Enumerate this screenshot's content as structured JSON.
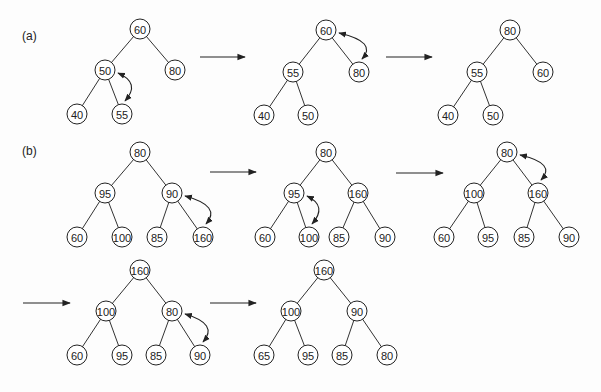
{
  "figure": {
    "parts": [
      {
        "label": "(a)",
        "label_pos": [
          22,
          40
        ],
        "trees": [
          {
            "id": "a1",
            "nodes": [
              {
                "v": "60",
                "x": 140,
                "y": 29
              },
              {
                "v": "50",
                "x": 105,
                "y": 70
              },
              {
                "v": "80",
                "x": 175,
                "y": 70
              },
              {
                "v": "40",
                "x": 77,
                "y": 114
              },
              {
                "v": "55",
                "x": 122,
                "y": 114
              }
            ],
            "edges": [
              [
                0,
                1
              ],
              [
                0,
                2
              ],
              [
                1,
                3
              ],
              [
                1,
                4
              ]
            ],
            "swap": [
              1,
              4
            ]
          },
          {
            "id": "a2",
            "nodes": [
              {
                "v": "60",
                "x": 326,
                "y": 30
              },
              {
                "v": "55",
                "x": 293,
                "y": 72
              },
              {
                "v": "80",
                "x": 359,
                "y": 72
              },
              {
                "v": "40",
                "x": 264,
                "y": 115
              },
              {
                "v": "50",
                "x": 308,
                "y": 115
              }
            ],
            "edges": [
              [
                0,
                1
              ],
              [
                0,
                2
              ],
              [
                1,
                3
              ],
              [
                1,
                4
              ]
            ],
            "swap": [
              0,
              2
            ]
          },
          {
            "id": "a3",
            "nodes": [
              {
                "v": "80",
                "x": 510,
                "y": 30
              },
              {
                "v": "55",
                "x": 477,
                "y": 72
              },
              {
                "v": "60",
                "x": 543,
                "y": 72
              },
              {
                "v": "40",
                "x": 448,
                "y": 115
              },
              {
                "v": "50",
                "x": 493,
                "y": 115
              }
            ],
            "edges": [
              [
                0,
                1
              ],
              [
                0,
                2
              ],
              [
                1,
                3
              ],
              [
                1,
                4
              ]
            ],
            "swap": null
          }
        ],
        "arrows": [
          {
            "x1": 200,
            "x2": 245,
            "y": 57
          },
          {
            "x1": 386,
            "x2": 432,
            "y": 57
          }
        ]
      },
      {
        "label": "(b)",
        "label_pos": [
          22,
          155
        ],
        "trees": [
          {
            "id": "b1",
            "nodes": [
              {
                "v": "80",
                "x": 140,
                "y": 152
              },
              {
                "v": "95",
                "x": 105,
                "y": 193
              },
              {
                "v": "90",
                "x": 172,
                "y": 193
              },
              {
                "v": "60",
                "x": 77,
                "y": 237
              },
              {
                "v": "100",
                "x": 122,
                "y": 237
              },
              {
                "v": "85",
                "x": 157,
                "y": 237
              },
              {
                "v": "160",
                "x": 203,
                "y": 237
              }
            ],
            "edges": [
              [
                0,
                1
              ],
              [
                0,
                2
              ],
              [
                1,
                3
              ],
              [
                1,
                4
              ],
              [
                2,
                5
              ],
              [
                2,
                6
              ]
            ],
            "swap": [
              2,
              6
            ]
          },
          {
            "id": "b2",
            "nodes": [
              {
                "v": "80",
                "x": 326,
                "y": 152
              },
              {
                "v": "95",
                "x": 294,
                "y": 193
              },
              {
                "v": "160",
                "x": 358,
                "y": 193
              },
              {
                "v": "60",
                "x": 265,
                "y": 237
              },
              {
                "v": "100",
                "x": 309,
                "y": 237
              },
              {
                "v": "85",
                "x": 339,
                "y": 237
              },
              {
                "v": "90",
                "x": 385,
                "y": 237
              }
            ],
            "edges": [
              [
                0,
                1
              ],
              [
                0,
                2
              ],
              [
                1,
                3
              ],
              [
                1,
                4
              ],
              [
                2,
                5
              ],
              [
                2,
                6
              ]
            ],
            "swap": [
              1,
              4
            ]
          },
          {
            "id": "b3",
            "nodes": [
              {
                "v": "80",
                "x": 507,
                "y": 152
              },
              {
                "v": "100",
                "x": 474,
                "y": 193
              },
              {
                "v": "160",
                "x": 538,
                "y": 193
              },
              {
                "v": "60",
                "x": 444,
                "y": 237
              },
              {
                "v": "95",
                "x": 488,
                "y": 237
              },
              {
                "v": "85",
                "x": 524,
                "y": 237
              },
              {
                "v": "90",
                "x": 569,
                "y": 237
              }
            ],
            "edges": [
              [
                0,
                1
              ],
              [
                0,
                2
              ],
              [
                1,
                3
              ],
              [
                1,
                4
              ],
              [
                2,
                5
              ],
              [
                2,
                6
              ]
            ],
            "swap": [
              0,
              2
            ]
          },
          {
            "id": "b4",
            "nodes": [
              {
                "v": "160",
                "x": 140,
                "y": 270
              },
              {
                "v": "100",
                "x": 106,
                "y": 311
              },
              {
                "v": "80",
                "x": 172,
                "y": 311
              },
              {
                "v": "60",
                "x": 77,
                "y": 355
              },
              {
                "v": "95",
                "x": 122,
                "y": 355
              },
              {
                "v": "85",
                "x": 156,
                "y": 355
              },
              {
                "v": "90",
                "x": 200,
                "y": 355
              }
            ],
            "edges": [
              [
                0,
                1
              ],
              [
                0,
                2
              ],
              [
                1,
                3
              ],
              [
                1,
                4
              ],
              [
                2,
                5
              ],
              [
                2,
                6
              ]
            ],
            "swap": [
              2,
              6
            ]
          },
          {
            "id": "b5",
            "nodes": [
              {
                "v": "160",
                "x": 324,
                "y": 270
              },
              {
                "v": "100",
                "x": 291,
                "y": 311
              },
              {
                "v": "90",
                "x": 357,
                "y": 311
              },
              {
                "v": "65",
                "x": 264,
                "y": 355
              },
              {
                "v": "95",
                "x": 308,
                "y": 355
              },
              {
                "v": "85",
                "x": 342,
                "y": 355
              },
              {
                "v": "80",
                "x": 387,
                "y": 355
              }
            ],
            "edges": [
              [
                0,
                1
              ],
              [
                0,
                2
              ],
              [
                1,
                3
              ],
              [
                1,
                4
              ],
              [
                2,
                5
              ],
              [
                2,
                6
              ]
            ],
            "swap": null
          }
        ],
        "arrows": [
          {
            "x1": 210,
            "x2": 256,
            "y": 172
          },
          {
            "x1": 396,
            "x2": 443,
            "y": 173
          },
          {
            "x1": 23,
            "x2": 70,
            "y": 303
          },
          {
            "x1": 210,
            "x2": 256,
            "y": 303
          }
        ]
      }
    ],
    "node_radius": 10,
    "colors": {
      "stroke": "#222222",
      "background": "#fdfdfd"
    }
  }
}
